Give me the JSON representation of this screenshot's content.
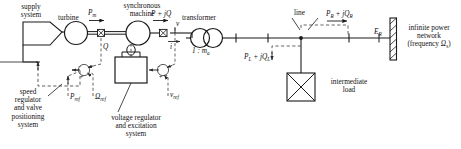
{
  "diagram": {
    "colors": {
      "line": "#1a1a1a",
      "dashed": "#4a4a4a",
      "text": "#111111"
    },
    "labels": {
      "supply_system": "supply\nsystem",
      "turbine": "turbine",
      "mech_power": "P",
      "mech_power_sub": "m",
      "synchronous_machine": "synchronous\nmachine",
      "electrical_power": "P + jQ",
      "transformer": "transformer",
      "turns_ratio": "1 : m",
      "turns_ratio_sub": "a",
      "terminal_voltage": "v",
      "terminal_current": "i",
      "line": "line",
      "receiving_power": "P",
      "receiving_power_sub1": "R",
      "receiving_power_2": " + jQ",
      "receiving_power_sub2": "R",
      "infinite_voltage": "E",
      "infinite_voltage_sub": "R",
      "infinite_network": "infinite power\nnetwork",
      "infinite_frequency": "(frequency ",
      "infinite_frequency_sym": "Ω",
      "infinite_frequency_sub": "s",
      "infinite_frequency_end": ")",
      "load_power": "P",
      "load_power_sub1": "L",
      "load_power_2": " + jQ",
      "load_power_sub2": "L",
      "intermediate_load": "intermediate\nload",
      "speed_regulator": "speed\nregulator\nand valve\npositioning\nsystem",
      "voltage_regulator": "voltage regulator\nand excitation\nsystem",
      "power_ref": "P",
      "power_ref_sub": "ref",
      "speed_ref": "Ω",
      "speed_ref_sub": "ref",
      "voltage_ref": "v",
      "voltage_ref_sub": "ref",
      "reactive_feedback": "Q",
      "sum_plus": "+",
      "sum_minus": "−"
    }
  }
}
